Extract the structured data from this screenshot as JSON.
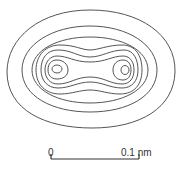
{
  "figure": {
    "type": "electron density contour map",
    "contour_color": "#555555",
    "contour_count": 7
  },
  "scale_bar": {
    "start_label": "0",
    "end_label": "0.1 nm",
    "color": "#333333"
  }
}
